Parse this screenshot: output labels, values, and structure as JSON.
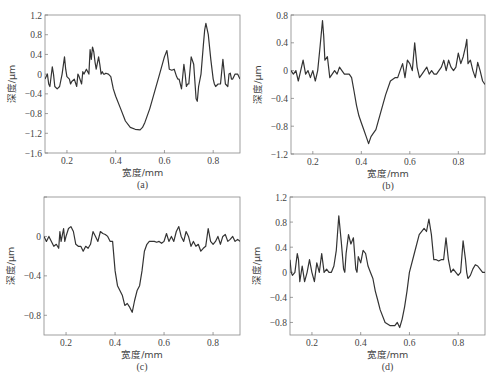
{
  "chart_data": [
    {
      "id": "a",
      "type": "line",
      "sublabel": "(a)",
      "xlabel": "宽度/mm",
      "ylabel": "深度/μm",
      "xlim": [
        0.11,
        0.91
      ],
      "ylim": [
        -1.6,
        1.2
      ],
      "xticks": [
        0.2,
        0.4,
        0.6,
        0.8
      ],
      "xtick_labels": [
        "0.2",
        "0.4",
        "0.6",
        "0.8"
      ],
      "yticks": [
        1.2,
        0.8,
        0.4,
        0,
        -0.4,
        -0.8,
        -1.2,
        -1.6
      ],
      "ytick_labels": [
        "1.2",
        "0.8",
        "0.4",
        "0",
        "−0.4",
        "−0.8",
        "−1.2",
        "−1.6"
      ],
      "frame": {
        "x0": 45,
        "y0": 15,
        "x1": 240,
        "y1": 153
      },
      "x": [
        0.11,
        0.12,
        0.125,
        0.13,
        0.14,
        0.145,
        0.15,
        0.16,
        0.17,
        0.18,
        0.19,
        0.195,
        0.2,
        0.21,
        0.215,
        0.22,
        0.23,
        0.24,
        0.245,
        0.25,
        0.26,
        0.265,
        0.27,
        0.28,
        0.29,
        0.295,
        0.3,
        0.305,
        0.31,
        0.315,
        0.32,
        0.33,
        0.335,
        0.34,
        0.345,
        0.35,
        0.355,
        0.36,
        0.37,
        0.38,
        0.39,
        0.4,
        0.42,
        0.44,
        0.46,
        0.48,
        0.5,
        0.51,
        0.52,
        0.54,
        0.56,
        0.58,
        0.6,
        0.61,
        0.615,
        0.62,
        0.63,
        0.64,
        0.65,
        0.655,
        0.66,
        0.67,
        0.68,
        0.685,
        0.69,
        0.695,
        0.7,
        0.71,
        0.72,
        0.73,
        0.735,
        0.74,
        0.75,
        0.755,
        0.76,
        0.765,
        0.77,
        0.78,
        0.79,
        0.8,
        0.805,
        0.81,
        0.82,
        0.83,
        0.84,
        0.85,
        0.86,
        0.865,
        0.87,
        0.875,
        0.88,
        0.89,
        0.9,
        0.91
      ],
      "y": [
        -0.1,
        0.0,
        -0.2,
        -0.25,
        0.15,
        0.0,
        -0.25,
        -0.3,
        -0.25,
        0.0,
        0.35,
        0.1,
        -0.05,
        -0.1,
        -0.2,
        -0.15,
        -0.1,
        -0.25,
        0.0,
        -0.05,
        -0.2,
        0.05,
        0.0,
        0.1,
        0.0,
        0.5,
        0.3,
        0.55,
        0.45,
        0.25,
        0.1,
        0.35,
        0.2,
        0.0,
        0.05,
        0.0,
        0.0,
        0.02,
        0.0,
        -0.05,
        -0.3,
        -0.45,
        -0.7,
        -0.95,
        -1.08,
        -1.12,
        -1.13,
        -1.08,
        -0.98,
        -0.7,
        -0.35,
        0.0,
        0.35,
        0.48,
        0.3,
        0.1,
        0.08,
        0.1,
        -0.05,
        -0.1,
        -0.1,
        -0.3,
        0.2,
        0.0,
        -0.25,
        -0.2,
        -0.2,
        0.35,
        0.2,
        -0.5,
        -0.55,
        -0.25,
        0.0,
        0.3,
        0.6,
        0.9,
        1.03,
        0.8,
        0.3,
        -0.1,
        -0.2,
        -0.25,
        -0.2,
        -0.2,
        0.3,
        -0.2,
        -0.25,
        0.0,
        0.02,
        -0.1,
        -0.1,
        0.0,
        0.0,
        -0.1
      ]
    },
    {
      "id": "b",
      "type": "line",
      "sublabel": "(b)",
      "xlabel": "宽度/mm",
      "ylabel": "深度/μm",
      "xlim": [
        0.11,
        0.91
      ],
      "ylim": [
        -1.2,
        0.8
      ],
      "xticks": [
        0.2,
        0.4,
        0.6,
        0.8
      ],
      "xtick_labels": [
        "0.2",
        "0.4",
        "0.6",
        "0.8"
      ],
      "yticks": [
        0.8,
        0.4,
        0,
        -0.4,
        -0.8,
        -1.2
      ],
      "ytick_labels": [
        "0.8",
        "0.4",
        "0",
        "−0.4",
        "−0.8",
        "−1.2"
      ],
      "frame": {
        "x0": 291,
        "y0": 15,
        "x1": 485,
        "y1": 154
      },
      "x": [
        0.11,
        0.12,
        0.13,
        0.14,
        0.15,
        0.16,
        0.17,
        0.18,
        0.19,
        0.2,
        0.21,
        0.22,
        0.23,
        0.24,
        0.245,
        0.25,
        0.26,
        0.27,
        0.28,
        0.29,
        0.3,
        0.31,
        0.32,
        0.33,
        0.34,
        0.35,
        0.36,
        0.37,
        0.38,
        0.39,
        0.4,
        0.41,
        0.42,
        0.43,
        0.44,
        0.45,
        0.46,
        0.48,
        0.5,
        0.52,
        0.54,
        0.55,
        0.56,
        0.57,
        0.58,
        0.59,
        0.6,
        0.61,
        0.62,
        0.63,
        0.64,
        0.65,
        0.66,
        0.67,
        0.68,
        0.69,
        0.7,
        0.71,
        0.72,
        0.73,
        0.74,
        0.75,
        0.76,
        0.77,
        0.78,
        0.79,
        0.8,
        0.81,
        0.82,
        0.83,
        0.835,
        0.84,
        0.85,
        0.86,
        0.87,
        0.875,
        0.88,
        0.89,
        0.9,
        0.91
      ],
      "y": [
        0.0,
        -0.05,
        0.0,
        -0.15,
        0.0,
        0.15,
        -0.05,
        0.0,
        -0.1,
        0.0,
        -0.15,
        0.0,
        0.35,
        0.72,
        0.5,
        0.15,
        0.2,
        -0.1,
        -0.05,
        0.0,
        -0.05,
        0.05,
        0.0,
        -0.05,
        -0.05,
        -0.05,
        -0.1,
        -0.3,
        -0.5,
        -0.65,
        -0.75,
        -0.85,
        -0.95,
        -1.05,
        -0.95,
        -0.9,
        -0.85,
        -0.6,
        -0.35,
        -0.15,
        -0.1,
        -0.1,
        0.0,
        0.1,
        -0.1,
        0.15,
        0.1,
        0.0,
        0.4,
        0.05,
        -0.1,
        -0.05,
        0.0,
        0.05,
        -0.05,
        0.0,
        -0.05,
        -0.05,
        0.0,
        0.05,
        0.15,
        0.0,
        0.15,
        0.05,
        0.0,
        0.05,
        0.25,
        0.1,
        0.2,
        0.35,
        0.45,
        0.1,
        0.15,
        0.0,
        -0.1,
        0.0,
        0.12,
        0.0,
        -0.15,
        -0.2
      ]
    },
    {
      "id": "c",
      "type": "line",
      "sublabel": "(c)",
      "xlabel": "宽度/mm",
      "ylabel": "深度/μm",
      "xlim": [
        0.11,
        0.91
      ],
      "ylim": [
        -1.0,
        0.4
      ],
      "xticks": [
        0.2,
        0.4,
        0.6,
        0.8
      ],
      "xtick_labels": [
        "0.2",
        "0.4",
        "0.6",
        "0.8"
      ],
      "yticks": [
        0.4,
        0,
        -0.4,
        -0.8
      ],
      "ytick_labels": [
        "",
        "0",
        "−0.4",
        "−0.8"
      ],
      "frame": {
        "x0": 44,
        "y0": 197,
        "x1": 240,
        "y1": 335
      },
      "x": [
        0.11,
        0.12,
        0.13,
        0.14,
        0.15,
        0.16,
        0.17,
        0.175,
        0.18,
        0.19,
        0.195,
        0.2,
        0.21,
        0.22,
        0.23,
        0.24,
        0.25,
        0.26,
        0.27,
        0.28,
        0.29,
        0.3,
        0.31,
        0.32,
        0.33,
        0.34,
        0.35,
        0.36,
        0.37,
        0.38,
        0.39,
        0.4,
        0.41,
        0.42,
        0.43,
        0.44,
        0.45,
        0.46,
        0.47,
        0.48,
        0.49,
        0.5,
        0.51,
        0.52,
        0.53,
        0.54,
        0.55,
        0.56,
        0.57,
        0.58,
        0.59,
        0.6,
        0.61,
        0.62,
        0.63,
        0.64,
        0.65,
        0.66,
        0.67,
        0.68,
        0.69,
        0.7,
        0.71,
        0.72,
        0.73,
        0.74,
        0.75,
        0.76,
        0.77,
        0.78,
        0.79,
        0.8,
        0.81,
        0.82,
        0.83,
        0.84,
        0.85,
        0.86,
        0.87,
        0.88,
        0.89,
        0.9,
        0.91
      ],
      "y": [
        0.0,
        -0.05,
        0.0,
        -0.05,
        -0.1,
        -0.08,
        -0.12,
        0.05,
        -0.05,
        0.08,
        -0.05,
        0.0,
        0.08,
        0.1,
        0.05,
        -0.08,
        -0.1,
        -0.1,
        -0.15,
        -0.1,
        -0.12,
        -0.08,
        0.05,
        0.0,
        -0.05,
        0.05,
        0.03,
        0.02,
        0.0,
        -0.05,
        -0.05,
        -0.35,
        -0.5,
        -0.55,
        -0.6,
        -0.7,
        -0.68,
        -0.72,
        -0.77,
        -0.65,
        -0.55,
        -0.5,
        -0.35,
        -0.15,
        -0.08,
        -0.05,
        -0.05,
        -0.05,
        -0.06,
        -0.05,
        -0.07,
        -0.05,
        0.03,
        -0.05,
        0.0,
        -0.05,
        0.05,
        0.1,
        0.0,
        -0.05,
        0.05,
        0.0,
        -0.1,
        -0.05,
        -0.1,
        -0.08,
        -0.15,
        -0.12,
        -0.1,
        0.08,
        -0.05,
        -0.08,
        -0.05,
        0.0,
        -0.08,
        0.0,
        0.02,
        -0.05,
        -0.03,
        0.0,
        -0.05,
        -0.03,
        -0.05
      ]
    },
    {
      "id": "d",
      "type": "line",
      "sublabel": "(d)",
      "xlabel": "宽度/mm",
      "ylabel": "深度/μm",
      "xlim": [
        0.11,
        0.91
      ],
      "ylim": [
        -1.0,
        1.2
      ],
      "xticks": [
        0.2,
        0.4,
        0.6,
        0.8
      ],
      "xtick_labels": [
        "0.2",
        "0.4",
        "0.6",
        "0.8"
      ],
      "yticks": [
        1.2,
        0.8,
        0.4,
        0,
        -0.4,
        -0.8
      ],
      "ytick_labels": [
        "1.2",
        "0.8",
        "0.4",
        "0",
        "−0.4",
        "−0.8"
      ],
      "frame": {
        "x0": 290,
        "y0": 197,
        "x1": 485,
        "y1": 335
      },
      "x": [
        0.11,
        0.115,
        0.12,
        0.13,
        0.14,
        0.145,
        0.15,
        0.16,
        0.17,
        0.18,
        0.19,
        0.2,
        0.21,
        0.22,
        0.23,
        0.24,
        0.25,
        0.26,
        0.27,
        0.28,
        0.29,
        0.3,
        0.31,
        0.32,
        0.33,
        0.335,
        0.34,
        0.35,
        0.36,
        0.37,
        0.38,
        0.385,
        0.39,
        0.4,
        0.41,
        0.42,
        0.43,
        0.44,
        0.45,
        0.46,
        0.47,
        0.48,
        0.5,
        0.52,
        0.53,
        0.54,
        0.55,
        0.56,
        0.57,
        0.58,
        0.59,
        0.6,
        0.62,
        0.64,
        0.66,
        0.67,
        0.68,
        0.69,
        0.7,
        0.71,
        0.72,
        0.73,
        0.74,
        0.75,
        0.76,
        0.77,
        0.78,
        0.79,
        0.8,
        0.81,
        0.82,
        0.83,
        0.835,
        0.84,
        0.85,
        0.86,
        0.87,
        0.88,
        0.89,
        0.9,
        0.91
      ],
      "y": [
        0.2,
        0.0,
        -0.05,
        0.0,
        0.3,
        0.2,
        -0.15,
        0.1,
        -0.15,
        0.0,
        0.2,
        0.0,
        -0.15,
        0.15,
        0.0,
        0.3,
        0.0,
        0.05,
        0.0,
        0.0,
        0.1,
        0.35,
        0.9,
        0.5,
        0.05,
        0.0,
        0.3,
        0.6,
        0.45,
        0.55,
        0.05,
        0.0,
        0.25,
        0.15,
        0.35,
        0.3,
        0.1,
        0.0,
        -0.1,
        -0.3,
        -0.45,
        -0.6,
        -0.8,
        -0.85,
        -0.85,
        -0.85,
        -0.8,
        -0.88,
        -0.75,
        -0.55,
        -0.3,
        0.0,
        0.3,
        0.6,
        0.7,
        0.65,
        0.85,
        0.6,
        0.2,
        0.2,
        0.18,
        0.2,
        0.2,
        0.55,
        0.2,
        0.0,
        0.05,
        0.0,
        -0.05,
        0.0,
        0.5,
        0.2,
        0.0,
        -0.1,
        -0.05,
        0.05,
        0.12,
        0.1,
        0.05,
        0.0,
        0.0
      ]
    }
  ]
}
